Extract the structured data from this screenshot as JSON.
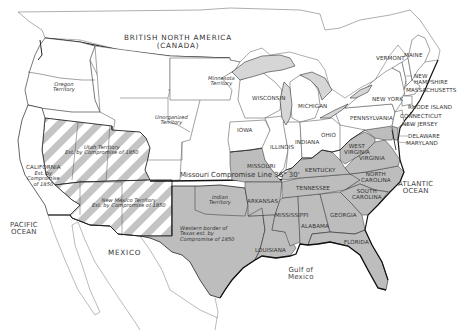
{
  "map": {
    "title": "United States after the Compromise of 1850",
    "colors": {
      "water": "#ffffff",
      "free_states": "#ffffff",
      "slave_states": "#bdbdbd",
      "lakes": "#d6d6d6",
      "border": "#2a2a2a",
      "hatch_light": "#ffffff",
      "hatch_dark": "#c4c4c4"
    },
    "legend_semantics": {
      "shaded_gray": "Slave states",
      "white": "Free states and unorganized territories",
      "hatched": "Territories established by Compromise of 1850 (popular sovereignty)"
    },
    "foreign": {
      "canada_line1": "BRITISH NORTH AMERICA",
      "canada_line2": "(CANADA)",
      "mexico": "MEXICO"
    },
    "water_bodies": {
      "pacific_line1": "PACIFIC",
      "pacific_line2": "OCEAN",
      "atlantic_line1": "ATLANTIC",
      "atlantic_line2": "OCEAN",
      "gulf_line1": "Gulf of",
      "gulf_line2": "Mexico"
    },
    "territories": {
      "oregon_line1": "Oregon",
      "oregon_line2": "Territory",
      "minnesota_line1": "Minnesota",
      "minnesota_line2": "Territory",
      "unorganized_line1": "Unorganized",
      "unorganized_line2": "Territory",
      "utah_line1": "Utah Territory",
      "utah_line2": "Est. by Compromise of 1850",
      "newmexico_line1": "New Mexico Territory",
      "newmexico_line2": "Est. by Compromise of 1850",
      "indian_line1": "Indian",
      "indian_line2": "Territory",
      "texas_line1": "Western border of",
      "texas_line2": "Texas est. by",
      "texas_line3": "Compromise of 1850"
    },
    "california": {
      "line1": "CALIFORNIA",
      "line2": "Est. by",
      "line3": "Compromise",
      "line4": "of 1850"
    },
    "missouri_line": "Missouri Compromise Line 36° 30'",
    "free_states": {
      "maine": "MAINE",
      "vermont": "VERMONT",
      "new_hampshire_line1": "NEW",
      "new_hampshire_line2": "HAMPSHIRE",
      "massachusetts": "MASSACHUSETTS",
      "rhode_island": "RHODE ISLAND",
      "connecticut": "CONNECTICUT",
      "new_jersey": "NEW JERSEY",
      "new_york": "NEW YORK",
      "pennsylvania": "PENNSYLVANIA",
      "ohio": "OHIO",
      "indiana": "INDIANA",
      "illinois": "ILLINOIS",
      "michigan": "MICHIGAN",
      "wisconsin": "WISCONSIN",
      "iowa": "IOWA"
    },
    "slave_states": {
      "delaware": "DELAWARE",
      "maryland": "MARYLAND",
      "west_virginia_line1": "WEST",
      "west_virginia_line2": "VIRGINIA",
      "virginia": "VIRGINIA",
      "north_carolina_line1": "NORTH",
      "north_carolina_line2": "CAROLINA",
      "south_carolina_line1": "SOUTH",
      "south_carolina_line2": "CAROLINA",
      "georgia": "GEORGIA",
      "florida": "FLORIDA",
      "alabama": "ALABAMA",
      "mississippi": "MISSISSIPPI",
      "tennessee": "TENNESSEE",
      "kentucky": "KENTUCKY",
      "missouri": "MISSOURI",
      "arkansas": "ARKANSAS",
      "louisiana": "LOUISIANA"
    }
  }
}
